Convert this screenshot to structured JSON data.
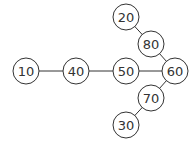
{
  "diagram": {
    "type": "graph",
    "nodes": [
      {
        "id": "n10",
        "label": "10",
        "x": 26,
        "y": 71
      },
      {
        "id": "n40",
        "label": "40",
        "x": 76,
        "y": 71
      },
      {
        "id": "n50",
        "label": "50",
        "x": 126,
        "y": 71
      },
      {
        "id": "n60",
        "label": "60",
        "x": 175,
        "y": 71
      },
      {
        "id": "n80",
        "label": "80",
        "x": 151,
        "y": 44
      },
      {
        "id": "n20",
        "label": "20",
        "x": 126,
        "y": 17
      },
      {
        "id": "n70",
        "label": "70",
        "x": 151,
        "y": 98
      },
      {
        "id": "n30",
        "label": "30",
        "x": 126,
        "y": 125
      }
    ],
    "edges": [
      [
        "10",
        "40"
      ],
      [
        "40",
        "50"
      ],
      [
        "50",
        "60"
      ],
      [
        "60",
        "80"
      ],
      [
        "80",
        "20"
      ],
      [
        "60",
        "70"
      ],
      [
        "70",
        "30"
      ]
    ]
  }
}
